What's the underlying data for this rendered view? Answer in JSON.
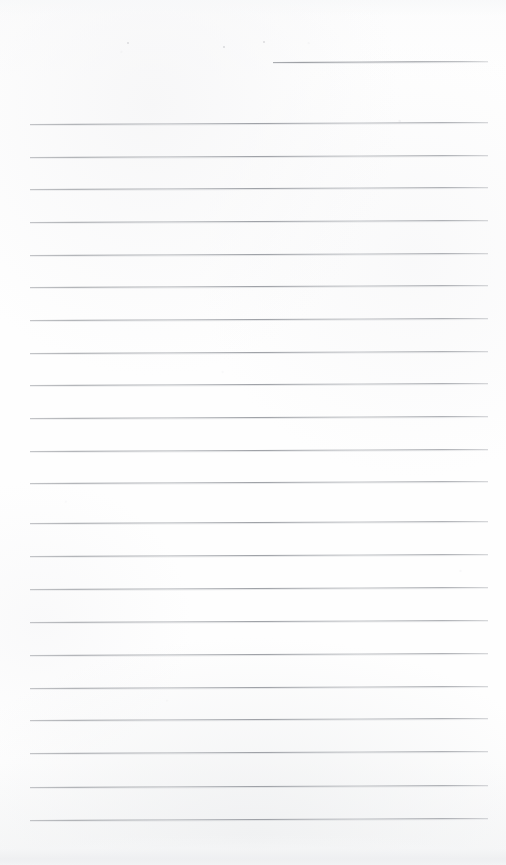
{
  "document": {
    "kind": "scanned-ruled-notebook-page",
    "title": "Blank ruled notebook page",
    "orientation": "portrait",
    "page_width": 506,
    "page_height": 865,
    "text_content": "",
    "has_handwriting": false,
    "colors": {
      "paper": "#fefefe",
      "rule_line": "#9a9da3",
      "scan_edge_shadow": "#eeeff1"
    }
  },
  "ruling": {
    "line_count_total": 23,
    "full_line_count": 22,
    "partial_line_count": 1,
    "line_spacing_px": 32.7,
    "left_margin_px": 30,
    "right_margin_px": 488,
    "line_tilt_deg": -0.26,
    "lines": [
      {
        "index": 1,
        "y": 62,
        "x_start": 273,
        "x_end": 488,
        "type": "partial"
      },
      {
        "index": 2,
        "y": 124,
        "x_start": 30,
        "x_end": 488,
        "type": "full"
      },
      {
        "index": 3,
        "y": 157,
        "x_start": 30,
        "x_end": 488,
        "type": "full"
      },
      {
        "index": 4,
        "y": 189,
        "x_start": 30,
        "x_end": 488,
        "type": "full"
      },
      {
        "index": 5,
        "y": 222,
        "x_start": 30,
        "x_end": 488,
        "type": "full"
      },
      {
        "index": 6,
        "y": 255,
        "x_start": 30,
        "x_end": 488,
        "type": "full"
      },
      {
        "index": 7,
        "y": 287,
        "x_start": 30,
        "x_end": 488,
        "type": "full"
      },
      {
        "index": 8,
        "y": 320,
        "x_start": 30,
        "x_end": 488,
        "type": "full"
      },
      {
        "index": 9,
        "y": 353,
        "x_start": 30,
        "x_end": 488,
        "type": "full"
      },
      {
        "index": 10,
        "y": 385,
        "x_start": 30,
        "x_end": 488,
        "type": "full"
      },
      {
        "index": 11,
        "y": 418,
        "x_start": 30,
        "x_end": 488,
        "type": "full"
      },
      {
        "index": 12,
        "y": 451,
        "x_start": 30,
        "x_end": 488,
        "type": "full"
      },
      {
        "index": 13,
        "y": 483,
        "x_start": 30,
        "x_end": 488,
        "type": "full"
      },
      {
        "index": 14,
        "y": 523,
        "x_start": 30,
        "x_end": 488,
        "type": "full"
      },
      {
        "index": 15,
        "y": 556,
        "x_start": 30,
        "x_end": 488,
        "type": "full"
      },
      {
        "index": 16,
        "y": 589,
        "x_start": 30,
        "x_end": 488,
        "type": "full"
      },
      {
        "index": 17,
        "y": 622,
        "x_start": 30,
        "x_end": 488,
        "type": "full"
      },
      {
        "index": 18,
        "y": 655,
        "x_start": 30,
        "x_end": 488,
        "type": "full"
      },
      {
        "index": 19,
        "y": 688,
        "x_start": 30,
        "x_end": 488,
        "type": "full"
      },
      {
        "index": 20,
        "y": 720,
        "x_start": 30,
        "x_end": 488,
        "type": "full"
      },
      {
        "index": 21,
        "y": 753,
        "x_start": 30,
        "x_end": 488,
        "type": "full"
      },
      {
        "index": 22,
        "y": 787,
        "x_start": 30,
        "x_end": 488,
        "type": "full"
      },
      {
        "index": 23,
        "y": 820,
        "x_start": 30,
        "x_end": 488,
        "type": "full"
      }
    ]
  },
  "artifacts": {
    "specks": [
      {
        "x": 127,
        "y": 42,
        "size": 2
      },
      {
        "x": 223,
        "y": 46,
        "size": 1.6
      },
      {
        "x": 263,
        "y": 41,
        "size": 2.2
      }
    ]
  }
}
